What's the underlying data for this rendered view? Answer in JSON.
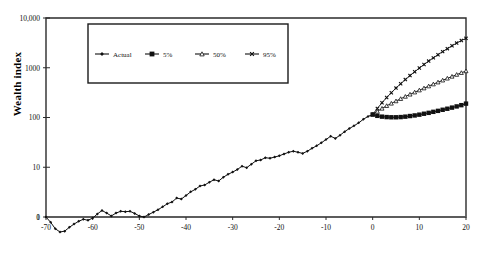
{
  "chart_data": {
    "type": "line",
    "title": "",
    "xlabel": "",
    "ylabel": "Wealth index",
    "yscale": "log",
    "ylim": [
      1,
      10000
    ],
    "xlim": [
      -70,
      20
    ],
    "ytick_labels": [
      "1",
      "10",
      "100",
      "1000",
      "10,000"
    ],
    "ytick_values": [
      1,
      10,
      100,
      1000,
      10000
    ],
    "xtick_labels": [
      "-70",
      "-60",
      "-50",
      "-40",
      "-30",
      "-20",
      "-10",
      "0",
      "10",
      "20"
    ],
    "xtick_values": [
      -70,
      -60,
      -50,
      -40,
      -30,
      -20,
      -10,
      0,
      10,
      20
    ],
    "origin_label": "0",
    "grid": false,
    "reference_line_y": 1,
    "legend_position": "top-center",
    "legend": [
      "Actual",
      "5%",
      "50%",
      "95%"
    ],
    "series": [
      {
        "name": "Actual",
        "marker": "diamond",
        "x": [
          -70,
          -69,
          -68,
          -67,
          -66,
          -65,
          -64,
          -63,
          -62,
          -61,
          -60,
          -59,
          -58,
          -57,
          -56,
          -55,
          -54,
          -53,
          -52,
          -51,
          -50,
          -49,
          -48,
          -47,
          -46,
          -45,
          -44,
          -43,
          -42,
          -41,
          -40,
          -39,
          -38,
          -37,
          -36,
          -35,
          -34,
          -33,
          -32,
          -31,
          -30,
          -29,
          -28,
          -27,
          -26,
          -25,
          -24,
          -23,
          -22,
          -21,
          -20,
          -19,
          -18,
          -17,
          -16,
          -15,
          -14,
          -13,
          -12,
          -11,
          -10,
          -9,
          -8,
          -7,
          -6,
          -5,
          -4,
          -3,
          -2,
          -1,
          0
        ],
        "values": [
          1.0,
          0.78,
          0.58,
          0.5,
          0.52,
          0.62,
          0.72,
          0.82,
          0.9,
          0.86,
          0.95,
          1.15,
          1.35,
          1.2,
          1.05,
          1.2,
          1.3,
          1.28,
          1.3,
          1.18,
          1.05,
          1.0,
          1.12,
          1.25,
          1.4,
          1.6,
          1.85,
          2.0,
          2.4,
          2.3,
          2.7,
          3.2,
          3.6,
          4.2,
          4.4,
          5.0,
          5.6,
          5.3,
          6.3,
          7.2,
          8.0,
          9.0,
          10.5,
          9.8,
          11.5,
          13.5,
          14.0,
          15.5,
          15.2,
          16.0,
          17.0,
          18.5,
          20.0,
          21.0,
          20.0,
          19.0,
          21.0,
          24.0,
          27.0,
          31.0,
          36.0,
          42.0,
          38.0,
          44.0,
          52.0,
          60.0,
          68.0,
          78.0,
          92.0,
          105.0,
          115.0
        ]
      },
      {
        "name": "5%",
        "marker": "square",
        "x": [
          0,
          1,
          2,
          3,
          4,
          5,
          6,
          7,
          8,
          9,
          10,
          11,
          12,
          13,
          14,
          15,
          16,
          17,
          18,
          19,
          20
        ],
        "values": [
          115,
          108,
          104,
          102,
          101,
          101,
          102,
          104,
          107,
          110,
          114,
          119,
          124,
          130,
          136,
          143,
          150,
          158,
          167,
          177,
          190
        ]
      },
      {
        "name": "50%",
        "marker": "triangle",
        "x": [
          0,
          1,
          2,
          3,
          4,
          5,
          6,
          7,
          8,
          9,
          10,
          11,
          12,
          13,
          14,
          15,
          16,
          17,
          18,
          19,
          20
        ],
        "values": [
          115,
          132,
          152,
          172,
          192,
          214,
          238,
          264,
          292,
          322,
          354,
          389,
          427,
          468,
          512,
          560,
          612,
          668,
          728,
          793,
          860
        ]
      },
      {
        "name": "95%",
        "marker": "cross",
        "x": [
          0,
          1,
          2,
          3,
          4,
          5,
          6,
          7,
          8,
          9,
          10,
          11,
          12,
          13,
          14,
          15,
          16,
          17,
          18,
          19,
          20
        ],
        "values": [
          115,
          152,
          198,
          252,
          315,
          390,
          477,
          578,
          695,
          830,
          985,
          1160,
          1360,
          1580,
          1830,
          2110,
          2420,
          2760,
          3130,
          3520,
          3900
        ]
      }
    ]
  }
}
